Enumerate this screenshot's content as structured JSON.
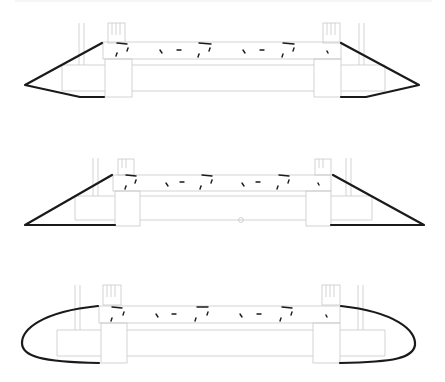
{
  "figure": {
    "variants": [
      {
        "id": "pointed",
        "label": "",
        "end_shape": "pointed-chevron"
      },
      {
        "id": "triangular",
        "label": "",
        "end_shape": "right-triangle"
      },
      {
        "id": "rounded",
        "label": "",
        "end_shape": "rounded-ellipse"
      }
    ],
    "colors": {
      "outline_thick": "#1a1a1a",
      "outline_thin": "#c8c8c8",
      "background": "#ffffff"
    }
  }
}
